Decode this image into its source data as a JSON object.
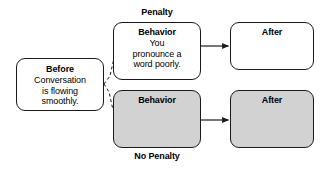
{
  "diagram": {
    "colors": {
      "shaded_fill": "#d2d2d2",
      "plain_fill": "#ffffff",
      "stroke": "#1a1a1a",
      "text": "#000000"
    },
    "captions": {
      "penalty": "Penalty",
      "no_penalty": "No Penalty"
    },
    "nodes": {
      "before": {
        "title": "Before",
        "body": [
          "Conversation",
          "is flowing",
          "smoothly."
        ],
        "fill": "plain"
      },
      "behavior_penalty": {
        "title": "Behavior",
        "body": [
          "You",
          "pronounce a",
          "word poorly."
        ],
        "fill": "plain"
      },
      "after_penalty": {
        "title": "After",
        "body": [],
        "fill": "plain"
      },
      "behavior_no_penalty": {
        "title": "Behavior",
        "body": [],
        "fill": "shaded"
      },
      "after_no_penalty": {
        "title": "After",
        "body": [],
        "fill": "shaded"
      }
    },
    "edges": [
      {
        "name": "before-to-behavior-penalty",
        "style": "dashed",
        "arrow": false
      },
      {
        "name": "before-to-behavior-no-penalty",
        "style": "dashed",
        "arrow": false
      },
      {
        "name": "behavior-penalty-to-after-penalty",
        "style": "solid",
        "arrow": true
      },
      {
        "name": "behavior-no-penalty-to-after-no-penalty",
        "style": "solid",
        "arrow": true
      }
    ]
  }
}
